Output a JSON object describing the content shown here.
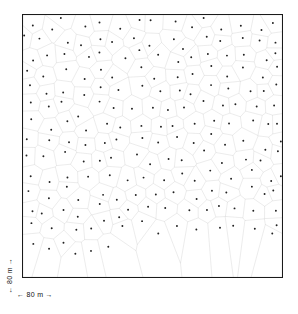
{
  "figure": {
    "type": "voronoi-tessellation-diagram",
    "frame": {
      "x": 22,
      "y": 14,
      "width": 261,
      "height": 264,
      "border_color": "#1a1a1a",
      "background": "#ffffff"
    },
    "style": {
      "cell_edge_color": "#8a8a8a",
      "cell_edge_width": 0.6,
      "point_color": "#222222",
      "point_radius": 0.9
    }
  },
  "scale": {
    "x_label": "← 80 m →",
    "y_label": "← 80 m →",
    "value": 80,
    "unit": "m"
  },
  "chart_data": {
    "type": "scatter",
    "title": "",
    "xlabel": "← 80 m →",
    "ylabel": "← 80 m →",
    "xlim": [
      0,
      80
    ],
    "ylim": [
      0,
      80
    ],
    "grid": false,
    "legend": null,
    "n_points": 208,
    "tessellation": "voronoi",
    "seed": 20240517,
    "x": [
      2.4,
      7.9,
      13.1,
      18.6,
      24.0,
      29.8,
      35.2,
      40.7,
      46.1,
      51.8,
      57.2,
      62.6,
      68.1,
      73.6,
      78.2,
      1.8,
      6.6,
      12.4,
      17.0,
      23.4,
      28.1,
      34.6,
      39.2,
      45.8,
      50.3,
      56.9,
      61.4,
      67.8,
      72.1,
      77.4,
      3.1,
      8.8,
      14.2,
      19.4,
      25.1,
      30.6,
      36.0,
      41.5,
      47.2,
      52.4,
      58.1,
      63.0,
      69.2,
      74.5,
      79.1,
      1.2,
      7.2,
      12.9,
      18.1,
      23.8,
      29.0,
      35.8,
      40.1,
      46.6,
      51.1,
      57.8,
      62.2,
      68.6,
      73.0,
      78.8,
      2.9,
      8.1,
      13.8,
      19.0,
      24.6,
      30.2,
      36.4,
      41.0,
      47.8,
      52.9,
      58.6,
      63.8,
      69.0,
      74.9,
      79.6,
      1.6,
      6.9,
      12.1,
      17.8,
      23.0,
      28.8,
      34.1,
      39.8,
      45.2,
      50.9,
      56.1,
      61.9,
      67.1,
      72.8,
      77.9,
      3.4,
      8.4,
      14.6,
      19.8,
      25.6,
      30.9,
      36.8,
      42.1,
      47.0,
      53.2,
      58.9,
      64.1,
      69.8,
      75.2,
      79.4,
      2.1,
      7.6,
      13.4,
      18.9,
      24.2,
      29.4,
      35.4,
      40.9,
      46.4,
      51.6,
      57.4,
      62.9,
      68.4,
      73.8,
      78.4,
      1.4,
      6.2,
      12.6,
      17.4,
      23.6,
      28.4,
      34.8,
      39.4,
      45.6,
      50.6,
      56.4,
      61.6,
      67.4,
      72.4,
      77.6,
      3.8,
      9.1,
      14.9,
      20.1,
      25.9,
      31.2,
      37.1,
      42.4,
      48.1,
      53.6,
      59.2,
      64.6,
      70.1,
      75.6,
      79.8,
      2.6,
      7.4,
      13.6,
      18.4,
      24.4,
      29.6,
      35.6,
      41.2,
      46.9,
      52.1,
      58.4,
      63.4,
      69.4,
      74.2,
      78.6,
      1.9,
      6.4,
      11.9,
      17.2,
      22.8,
      28.2,
      33.9,
      39.0,
      44.9,
      50.1,
      55.9,
      61.1,
      66.9,
      72.2,
      77.2,
      4.1,
      9.4,
      15.2,
      20.6,
      26.2,
      31.6,
      37.4,
      42.8,
      48.4,
      54.1,
      59.6,
      65.1,
      70.6,
      76.1,
      79.2,
      2.2,
      7.1,
      12.2,
      17.6,
      22.4,
      27.9
    ],
    "y": [
      2.2,
      3.1,
      1.9,
      3.6,
      2.1,
      3.4,
      1.6,
      3.2,
      2.6,
      3.8,
      1.4,
      3.0,
      2.4,
      3.9,
      2.0,
      7.4,
      8.2,
      6.9,
      8.6,
      7.1,
      8.4,
      6.6,
      8.1,
      7.6,
      8.9,
      6.4,
      8.0,
      7.2,
      8.8,
      7.0,
      12.6,
      13.4,
      12.1,
      13.8,
      12.4,
      13.6,
      11.9,
      13.2,
      12.8,
      14.1,
      11.6,
      13.0,
      12.2,
      14.0,
      12.0,
      17.8,
      18.6,
      17.2,
      19.0,
      17.6,
      18.8,
      17.1,
      18.4,
      18.0,
      19.2,
      16.9,
      18.2,
      17.4,
      19.1,
      17.0,
      23.0,
      23.8,
      22.4,
      24.2,
      22.8,
      24.0,
      22.2,
      23.6,
      23.2,
      24.4,
      22.0,
      23.4,
      22.6,
      24.3,
      22.1,
      28.2,
      29.0,
      27.6,
      29.4,
      28.0,
      29.2,
      27.4,
      28.8,
      28.4,
      29.6,
      27.2,
      28.6,
      27.8,
      29.5,
      27.3,
      33.4,
      34.2,
      32.8,
      34.6,
      33.2,
      34.4,
      32.6,
      34.0,
      33.6,
      34.8,
      32.4,
      33.8,
      33.0,
      34.7,
      32.5,
      38.6,
      39.4,
      38.0,
      39.8,
      38.4,
      39.6,
      37.8,
      39.2,
      38.8,
      40.0,
      37.6,
      39.0,
      38.2,
      39.9,
      37.7,
      43.8,
      44.6,
      43.2,
      45.0,
      43.6,
      44.8,
      43.0,
      44.4,
      44.0,
      45.2,
      42.8,
      44.2,
      43.4,
      45.1,
      42.9,
      49.0,
      49.8,
      48.4,
      50.2,
      48.8,
      50.0,
      48.2,
      49.6,
      49.2,
      50.4,
      48.0,
      49.4,
      48.6,
      50.3,
      48.1,
      54.2,
      55.0,
      53.6,
      55.4,
      54.0,
      55.2,
      53.4,
      54.8,
      54.4,
      55.6,
      53.2,
      54.6,
      53.8,
      55.5,
      53.3,
      59.4,
      60.2,
      58.8,
      60.6,
      59.2,
      60.4,
      58.6,
      60.0,
      59.6,
      60.8,
      58.4,
      59.8,
      59.0,
      60.7,
      58.5,
      64.6,
      65.4,
      64.0,
      65.8,
      64.4,
      65.6,
      63.8,
      65.2,
      64.8,
      66.0,
      63.6,
      65.0,
      64.2,
      65.9,
      63.7,
      70.8,
      71.6,
      70.2,
      72.0,
      70.6,
      71.8
    ]
  }
}
